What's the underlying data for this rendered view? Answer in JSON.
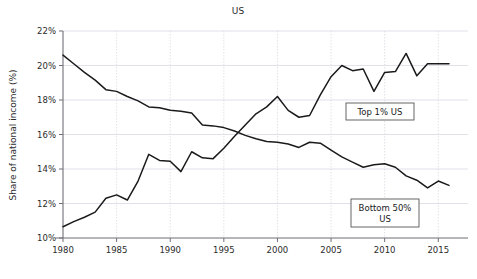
{
  "chart_data": {
    "type": "line",
    "title": "US",
    "xlabel": "",
    "ylabel": "Share of national income (%)",
    "xlim": [
      1980,
      2016
    ],
    "ylim": [
      10,
      22
    ],
    "xticks": [
      "1980",
      "1985",
      "1990",
      "1995",
      "2000",
      "2005",
      "2010",
      "2015"
    ],
    "xtick_values": [
      1980,
      1985,
      1990,
      1995,
      2000,
      2005,
      2010,
      2015
    ],
    "yticks": [
      "10%",
      "12%",
      "14%",
      "16%",
      "18%",
      "20%",
      "22%"
    ],
    "ytick_values": [
      10,
      12,
      14,
      16,
      18,
      20,
      22
    ],
    "grid": true,
    "legend_position": "inline-annotations",
    "x": [
      1980,
      1981,
      1982,
      1983,
      1984,
      1985,
      1986,
      1987,
      1988,
      1989,
      1990,
      1991,
      1992,
      1993,
      1994,
      1995,
      1996,
      1997,
      1998,
      1999,
      2000,
      2001,
      2002,
      2003,
      2004,
      2005,
      2006,
      2007,
      2008,
      2009,
      2010,
      2011,
      2012,
      2013,
      2014,
      2015,
      2016
    ],
    "series": [
      {
        "name": "Top 1% US",
        "values": [
          10.65,
          10.95,
          11.2,
          11.5,
          12.3,
          12.5,
          12.2,
          13.3,
          14.85,
          14.5,
          14.45,
          13.85,
          15.0,
          14.65,
          14.6,
          15.2,
          15.9,
          16.55,
          17.2,
          17.6,
          18.2,
          17.4,
          17.0,
          17.1,
          18.3,
          19.35,
          20.0,
          19.7,
          19.8,
          18.5,
          19.6,
          19.65,
          20.7,
          19.4,
          20.1,
          20.1,
          20.1
        ]
      },
      {
        "name": "Bottom 50% US",
        "values": [
          20.6,
          20.1,
          19.6,
          19.15,
          18.6,
          18.5,
          18.2,
          17.95,
          17.6,
          17.55,
          17.4,
          17.35,
          17.25,
          16.55,
          16.5,
          16.4,
          16.2,
          15.95,
          15.75,
          15.6,
          15.55,
          15.45,
          15.25,
          15.55,
          15.5,
          15.1,
          14.7,
          14.4,
          14.1,
          14.25,
          14.3,
          14.1,
          13.6,
          13.35,
          12.9,
          13.3,
          13.05
        ]
      }
    ],
    "annotations": [
      {
        "name": "top-1-percent-label",
        "text": "Top 1% US",
        "x_px": 380,
        "y_px": 112
      },
      {
        "name": "bottom-50-percent-label",
        "text_line1": "Bottom 50%",
        "text_line2": "US",
        "x_px": 385,
        "y_px": 214
      }
    ],
    "colors": {
      "line": "#1a1a1a",
      "grid": "#d9d9e3",
      "axis": "#808088",
      "text": "#2b2b2b",
      "background": "#ffffff",
      "annotation_border": "#555555"
    }
  }
}
